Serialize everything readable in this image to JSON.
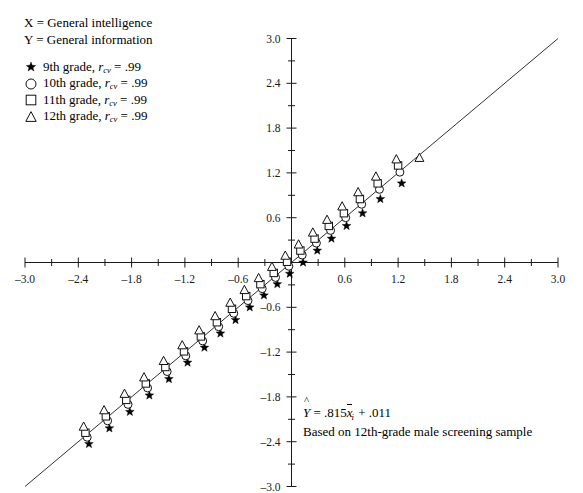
{
  "header": {
    "line_x": "X = General intelligence",
    "line_y": "Y = General information"
  },
  "legend": {
    "items": [
      {
        "glyph": "star-marker",
        "label": "9th grade, ",
        "stat_symbol": "r",
        "stat_sub": "cv",
        "stat_value": " = .99"
      },
      {
        "glyph": "circle-marker",
        "label": "10th grade, ",
        "stat_symbol": "r",
        "stat_sub": "cv",
        "stat_value": " = .99"
      },
      {
        "glyph": "square-marker",
        "label": "11th grade, ",
        "stat_symbol": "r",
        "stat_sub": "cv",
        "stat_value": " = .99"
      },
      {
        "glyph": "triangle-marker",
        "label": "12th grade, ",
        "stat_symbol": "r",
        "stat_sub": "cv",
        "stat_value": " = .99"
      }
    ]
  },
  "annotation": {
    "equation_prefix": "Y",
    "equation_body": " = .815",
    "equation_var": "x",
    "equation_sub": "i",
    "equation_suffix": " + .011",
    "note": "Based on 12th-grade male screening sample"
  },
  "chart_data": {
    "type": "scatter",
    "title": "",
    "xlabel": "",
    "ylabel": "",
    "xlim": [
      -3.0,
      3.0
    ],
    "ylim": [
      -3.0,
      3.0
    ],
    "xticks": [
      -3.0,
      -2.4,
      -1.8,
      -1.2,
      -0.6,
      0.6,
      1.2,
      1.8,
      2.4,
      3.0
    ],
    "yticks": [
      -3.0,
      -2.4,
      -1.8,
      -1.2,
      -0.6,
      0.6,
      1.2,
      1.8,
      2.4,
      3.0
    ],
    "xtick_labels": [
      "-3.0",
      "-2.4",
      "-1.8",
      "-1.2",
      "-0.6",
      "0.6",
      "1.2",
      "1.8",
      "2.4",
      "3.0"
    ],
    "ytick_labels": [
      "-3.0",
      "-2.4",
      "-1.8",
      "-1.2",
      "-0.6",
      "0.6",
      "1.2",
      "1.8",
      "2.4",
      "3.0"
    ],
    "minor_tick_step": 0.3,
    "grid": false,
    "legend_position": "upper-left-outside",
    "reference_line": {
      "name": "identity-line",
      "x0": -3.0,
      "y0": -3.0,
      "x1": 3.0,
      "y1": 3.0
    },
    "regression": {
      "slope": 0.815,
      "intercept": 0.011
    },
    "series": [
      {
        "name": "9th grade",
        "marker": "star",
        "x": [
          -2.28,
          -2.05,
          -1.82,
          -1.6,
          -1.38,
          -1.17,
          -0.98,
          -0.8,
          -0.63,
          -0.47,
          -0.31,
          -0.16,
          -0.02,
          0.13,
          0.29,
          0.45,
          0.62,
          0.8,
          1.0,
          1.24
        ],
        "y": [
          -2.43,
          -2.22,
          -2.0,
          -1.78,
          -1.56,
          -1.34,
          -1.14,
          -0.95,
          -0.77,
          -0.6,
          -0.44,
          -0.29,
          -0.15,
          0.0,
          0.16,
          0.32,
          0.49,
          0.66,
          0.85,
          1.06
        ]
      },
      {
        "name": "10th grade",
        "marker": "circle",
        "x": [
          -2.3,
          -2.07,
          -1.84,
          -1.62,
          -1.4,
          -1.19,
          -1.0,
          -0.82,
          -0.65,
          -0.49,
          -0.33,
          -0.18,
          -0.03,
          0.12,
          0.28,
          0.44,
          0.61,
          0.79,
          0.99,
          1.22
        ],
        "y": [
          -2.34,
          -2.12,
          -1.9,
          -1.68,
          -1.46,
          -1.25,
          -1.05,
          -0.86,
          -0.68,
          -0.51,
          -0.35,
          -0.2,
          -0.05,
          0.1,
          0.26,
          0.43,
          0.6,
          0.78,
          0.98,
          1.21
        ]
      },
      {
        "name": "11th grade",
        "marker": "square",
        "x": [
          -2.32,
          -2.09,
          -1.86,
          -1.64,
          -1.42,
          -1.21,
          -1.02,
          -0.84,
          -0.67,
          -0.51,
          -0.35,
          -0.2,
          -0.05,
          0.1,
          0.26,
          0.42,
          0.59,
          0.77,
          0.97,
          1.2
        ],
        "y": [
          -2.28,
          -2.06,
          -1.84,
          -1.62,
          -1.4,
          -1.19,
          -0.99,
          -0.8,
          -0.62,
          -0.45,
          -0.29,
          -0.14,
          0.01,
          0.16,
          0.32,
          0.49,
          0.66,
          0.85,
          1.06,
          1.3
        ]
      },
      {
        "name": "12th grade",
        "marker": "triangle",
        "x": [
          -2.34,
          -2.11,
          -1.88,
          -1.66,
          -1.44,
          -1.23,
          -1.04,
          -0.86,
          -0.69,
          -0.53,
          -0.37,
          -0.22,
          -0.07,
          0.08,
          0.24,
          0.4,
          0.57,
          0.75,
          0.95,
          1.18,
          1.44
        ],
        "y": [
          -2.2,
          -1.98,
          -1.76,
          -1.54,
          -1.32,
          -1.11,
          -0.91,
          -0.72,
          -0.54,
          -0.37,
          -0.21,
          -0.06,
          0.09,
          0.24,
          0.4,
          0.57,
          0.75,
          0.94,
          1.15,
          1.38,
          1.4
        ]
      }
    ]
  }
}
